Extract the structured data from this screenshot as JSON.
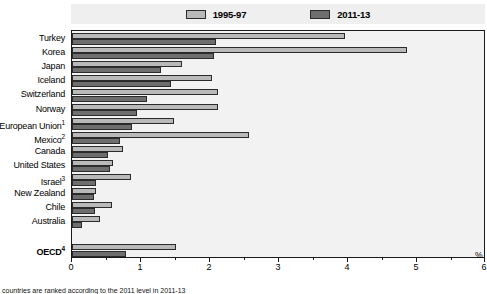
{
  "legend": {
    "entries": [
      {
        "label": "1995-97",
        "color": "#b9b9b9",
        "name": "legend-1995-97"
      },
      {
        "label": "2011-13",
        "color": "#6e6e6e",
        "name": "legend-2011-13"
      }
    ]
  },
  "axis": {
    "unit": "%",
    "ticks": [
      "0",
      "1",
      "2",
      "3",
      "4",
      "5",
      "6"
    ]
  },
  "footnote": "countries are ranked according to the 2011 level in 2011-13",
  "chart_data": {
    "type": "bar",
    "orientation": "horizontal",
    "title": "",
    "xlabel": "%",
    "ylabel": "",
    "xlim": [
      0,
      6
    ],
    "grid": false,
    "legend_position": "top",
    "categories": [
      "Turkey",
      "Korea",
      "Japan",
      "Iceland",
      "Switzerland",
      "Norway",
      "European Union¹",
      "Mexico²",
      "Canada",
      "United States",
      "Israel³",
      "New Zealand",
      "Chile",
      "Australia",
      "OECD⁴"
    ],
    "series": [
      {
        "name": "1995-97",
        "color": "#b9b9b9",
        "values": [
          3.95,
          4.85,
          1.6,
          2.03,
          2.11,
          2.12,
          1.48,
          2.56,
          0.74,
          0.6,
          0.85,
          0.35,
          0.58,
          0.4,
          1.5
        ]
      },
      {
        "name": "2011-13",
        "color": "#6e6e6e",
        "values": [
          2.09,
          2.06,
          1.29,
          1.43,
          1.08,
          0.94,
          0.87,
          0.7,
          0.52,
          0.55,
          0.35,
          0.32,
          0.33,
          0.14,
          0.78
        ]
      }
    ]
  }
}
